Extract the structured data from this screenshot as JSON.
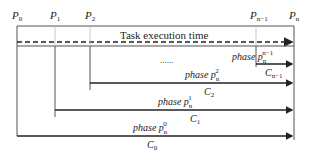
{
  "diagram": {
    "title": "Task execution time",
    "processes": [
      {
        "name": "P",
        "sub": "0"
      },
      {
        "name": "P",
        "sub": "1"
      },
      {
        "name": "P",
        "sub": "2"
      },
      {
        "name": "P",
        "sub": "n−1"
      },
      {
        "name": "P",
        "sub": "n"
      }
    ],
    "ellipsis": "......",
    "phases": [
      {
        "label": "phase",
        "var": "p",
        "sub": "n",
        "sup": "n−1",
        "cost": "C",
        "cost_sub": "n−1"
      },
      {
        "label": "phase",
        "var": "p",
        "sub": "n",
        "sup": "2",
        "cost": "C",
        "cost_sub": "2"
      },
      {
        "label": "phase",
        "var": "p",
        "sub": "n",
        "sup": "1",
        "cost": "C",
        "cost_sub": "1"
      },
      {
        "label": "phase",
        "var": "p",
        "sub": "n",
        "sup": "0",
        "cost": "C",
        "cost_sub": "0"
      }
    ],
    "colors": {
      "line": "#222222",
      "guide": "#bbbbbb"
    }
  }
}
